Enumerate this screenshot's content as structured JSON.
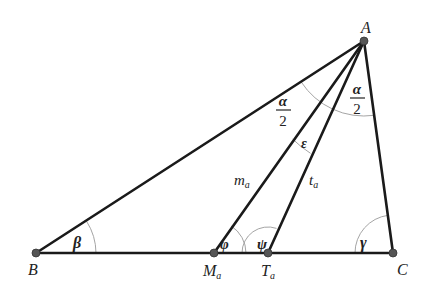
{
  "diagram": {
    "points": {
      "A": {
        "label": "A",
        "x": 364,
        "y": 41
      },
      "B": {
        "label": "B",
        "x": 36,
        "y": 253
      },
      "C": {
        "label": "C",
        "x": 393,
        "y": 253
      },
      "Ma": {
        "label": "M",
        "sub": "a",
        "x": 214,
        "y": 253
      },
      "Ta": {
        "label": "T",
        "sub": "a",
        "x": 268,
        "y": 253
      }
    },
    "segments": {
      "median": {
        "label": "m",
        "sub": "a"
      },
      "bisector": {
        "label": "t",
        "sub": "a"
      }
    },
    "angles": {
      "beta": "β",
      "gamma": "γ",
      "phi": "φ",
      "psi": "ψ",
      "epsilon": "ε",
      "alpha_half_left": {
        "num": "α",
        "den": "2"
      },
      "alpha_half_right": {
        "num": "α",
        "den": "2"
      }
    },
    "colors": {
      "line": "#1a1a1a",
      "arc": "#9a9a9a",
      "point": "#555555"
    }
  }
}
